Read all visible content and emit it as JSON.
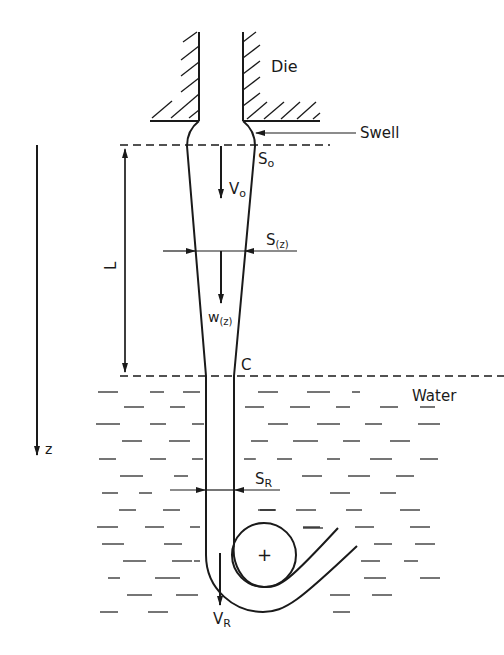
{
  "diagram": {
    "type": "schematic",
    "labels": {
      "die": "Die",
      "swell": "Swell",
      "s0_main": "S",
      "s0_sub": "o",
      "v0_main": "V",
      "v0_sub": "o",
      "sz_main": "S",
      "sz_sub": "(z)",
      "wz_main": "w",
      "wz_sub": "(z)",
      "length": "L",
      "point_c": "C",
      "water": "Water",
      "z_axis": "z",
      "sr_main": "S",
      "sr_sub": "R",
      "vr_main": "V",
      "vr_sub": "R",
      "roller_center": "+"
    },
    "colors": {
      "line": "#1a1a1a",
      "background": "#ffffff"
    }
  }
}
